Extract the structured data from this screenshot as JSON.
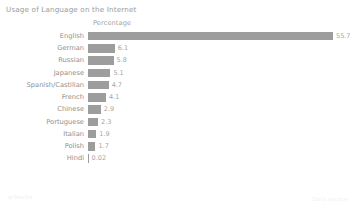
{
  "chart_data": {
    "type": "bar",
    "orientation": "horizontal",
    "title": "Usage of Language on the Internet",
    "xlabel": "Percentage",
    "ylabel": "",
    "categories": [
      "English",
      "German",
      "Russian",
      "Japanese",
      "Spanish/Castilian",
      "French",
      "Chinese",
      "Portuguese",
      "Italian",
      "Polish",
      "Hindi"
    ],
    "values": [
      55.7,
      6.1,
      5.8,
      5.1,
      4.7,
      4.1,
      2.9,
      2.3,
      1.9,
      1.7,
      0.02
    ],
    "value_labels": [
      "55.7",
      "6.1",
      "5.8",
      "5.1",
      "4.7",
      "4.1",
      "2.9",
      "2.3",
      "1.9",
      "1.7",
      "0.02"
    ],
    "xlim": [
      0,
      55.7
    ],
    "grid": false,
    "legend": null,
    "bar_color": "#9d9d9d",
    "text_color": "#909090"
  },
  "header": {
    "title": "Usage of Language on the Internet",
    "axis_header": "Percentage"
  },
  "footer": {
    "left_text": "w3techs",
    "right_text": "Data source"
  }
}
